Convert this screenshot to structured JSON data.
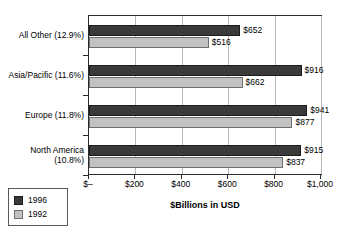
{
  "chart_data": {
    "type": "bar",
    "orientation": "horizontal",
    "title": "",
    "xlabel": "$Billions in USD",
    "ylabel": "",
    "xlim": [
      0,
      1000
    ],
    "grid": true,
    "legend_position": "bottom-left",
    "categories": [
      "All Other (12.9%)",
      "Asia/Pacific (11.6%)",
      "Europe (11.8%)",
      "North America\n(10.8%)"
    ],
    "series": [
      {
        "name": "1996",
        "color": "#3a3a3a",
        "values": [
          652,
          916,
          941,
          915
        ],
        "labels": [
          "$652",
          "$916",
          "$941",
          "$915"
        ]
      },
      {
        "name": "1992",
        "color": "#c2c2c2",
        "values": [
          516,
          662,
          877,
          837
        ],
        "labels": [
          "$516",
          "$662",
          "$877",
          "$837"
        ]
      }
    ],
    "xticks": [
      0,
      200,
      400,
      600,
      800,
      1000
    ],
    "xtick_labels": [
      "$–",
      "$200",
      "$400",
      "$600",
      "$800",
      "$1,000"
    ]
  },
  "legend": {
    "items": [
      {
        "label": "1996",
        "color": "#3a3a3a"
      },
      {
        "label": "1992",
        "color": "#c2c2c2"
      }
    ]
  },
  "axis": {
    "x_title": "$Billions in USD"
  },
  "clipped_header": ""
}
